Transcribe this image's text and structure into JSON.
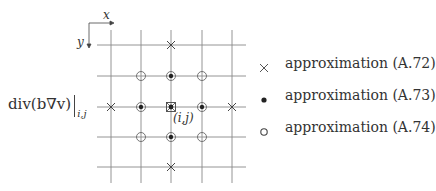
{
  "formula": {
    "main": "div(b∇v)",
    "subscript": "i,j"
  },
  "axes": {
    "x_label": "x",
    "y_label": "y"
  },
  "center_label": "(i,j)",
  "legend": [
    {
      "symbol": "cross-icon",
      "label": "approximation (A.72)"
    },
    {
      "symbol": "filled-dot-icon",
      "label": "approximation (A.73)"
    },
    {
      "symbol": "open-circle-icon",
      "label": "approximation (A.74)"
    }
  ],
  "grid": {
    "columns": 5,
    "rows": 5,
    "cross_points": [
      [
        2,
        0
      ],
      [
        0,
        2
      ],
      [
        4,
        2
      ],
      [
        2,
        4
      ]
    ],
    "filled_dot_points": [
      [
        2,
        1
      ],
      [
        1,
        2
      ],
      [
        2,
        2
      ],
      [
        3,
        2
      ],
      [
        2,
        3
      ]
    ],
    "open_circle_points": [
      [
        1,
        1
      ],
      [
        3,
        1
      ],
      [
        2,
        1
      ],
      [
        1,
        2
      ],
      [
        2,
        2
      ],
      [
        3,
        2
      ],
      [
        1,
        3
      ],
      [
        2,
        3
      ],
      [
        3,
        3
      ]
    ],
    "center_marker": [
      2,
      2
    ]
  },
  "colors": {
    "line": "#777777",
    "ink": "#333333"
  }
}
